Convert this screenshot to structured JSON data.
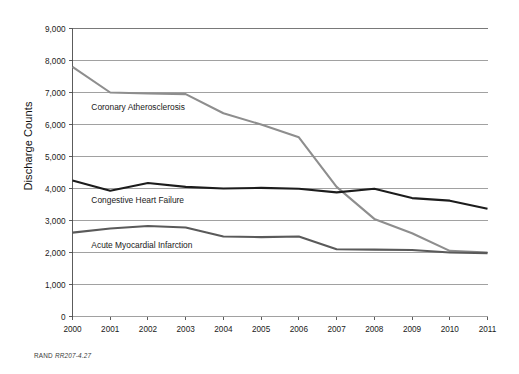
{
  "figure": {
    "credit_prefix": "RAND ",
    "credit_id": "RR207-4.27"
  },
  "chart_data": {
    "type": "line",
    "title": "",
    "xlabel": "",
    "ylabel": "Discharge Counts",
    "grid": true,
    "legend_position": "inline-labels",
    "x": [
      2000,
      2001,
      2002,
      2003,
      2004,
      2005,
      2006,
      2007,
      2008,
      2009,
      2010,
      2011
    ],
    "xtick_labels": [
      "2000",
      "2001",
      "2002",
      "2003",
      "2004",
      "2005",
      "2006",
      "2007",
      "2008",
      "2009",
      "2010",
      "2011"
    ],
    "ylim": [
      0,
      9000
    ],
    "ytick_values": [
      0,
      1000,
      2000,
      3000,
      4000,
      5000,
      6000,
      7000,
      8000,
      9000
    ],
    "ytick_labels": [
      "0",
      "1,000",
      "2,000",
      "3,000",
      "4,000",
      "5,000",
      "6,000",
      "7,000",
      "8,000",
      "9,000"
    ],
    "series": [
      {
        "name": "Coronary Atherosclerosis",
        "color": "#8e8e8e",
        "values": [
          7800,
          7000,
          6970,
          6950,
          6350,
          6000,
          5600,
          4050,
          3050,
          2600,
          2050,
          2000
        ],
        "label_x": 2000.5,
        "label_y": 6450
      },
      {
        "name": "Congestive Heart Failure",
        "color": "#1c1c1c",
        "values": [
          4250,
          3930,
          4170,
          4050,
          4000,
          4020,
          3990,
          3880,
          3990,
          3700,
          3620,
          3370
        ],
        "label_x": 2000.5,
        "label_y": 3560
      },
      {
        "name": "Acute Myocardial Infarction",
        "color": "#5a5a5a",
        "values": [
          2620,
          2750,
          2830,
          2780,
          2500,
          2480,
          2500,
          2100,
          2090,
          2080,
          2000,
          1980
        ],
        "label_x": 2000.5,
        "label_y": 2150
      }
    ]
  }
}
